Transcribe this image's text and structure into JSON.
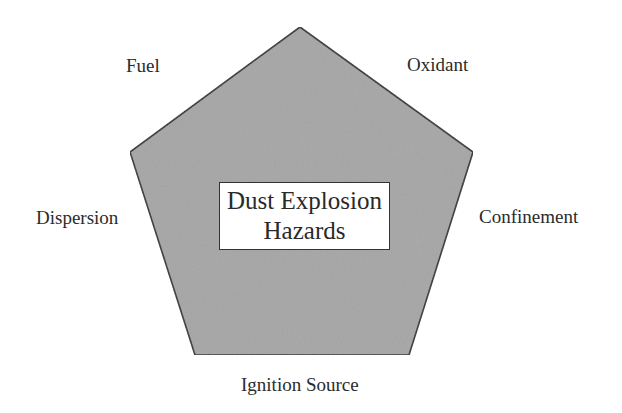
{
  "diagram": {
    "type": "pentagon",
    "title_lines": [
      "Dust Explosion",
      "Hazards"
    ],
    "title": "Dust Explosion Hazards",
    "vertices_labels": {
      "top_left": "Fuel",
      "top_right": "Oxidant",
      "right": "Confinement",
      "bottom": "Ignition Source",
      "left": "Dispersion"
    },
    "elements": [
      "Fuel",
      "Oxidant",
      "Confinement",
      "Ignition Source",
      "Dispersion"
    ],
    "colors": {
      "fill": "#a6a6a6",
      "stroke": "#333333",
      "box_fill": "#ffffff",
      "text": "#2a2a2a"
    }
  }
}
